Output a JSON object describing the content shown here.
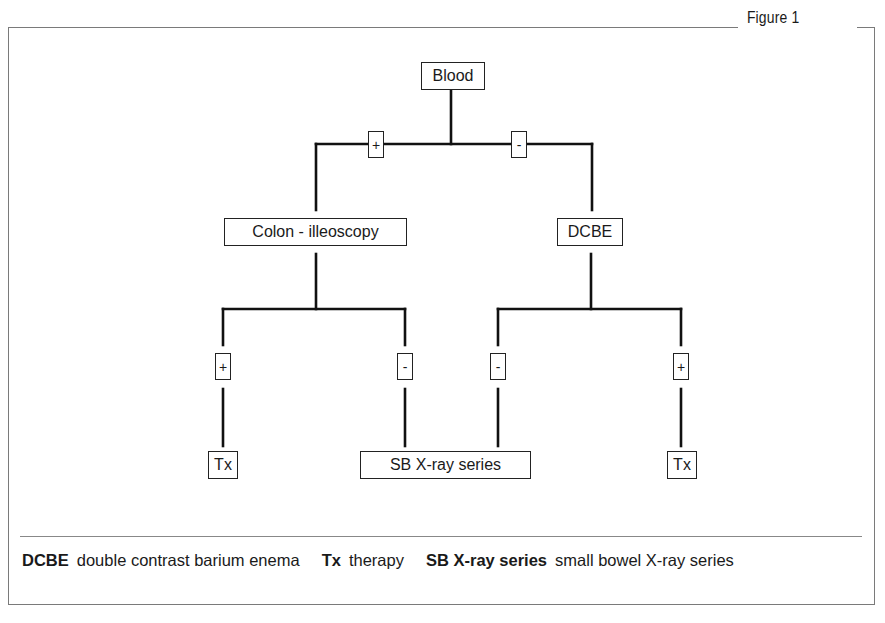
{
  "figure": {
    "title": "Figure 1"
  },
  "diagram": {
    "nodes": {
      "root": "Blood",
      "left": "Colon - illeoscopy",
      "right": "DCBE",
      "left_positive_outcome": "Tx",
      "shared_negative_outcome": "SB X-ray series",
      "right_positive_outcome": "Tx"
    },
    "edge_labels": {
      "root_left": "+",
      "root_right": "-",
      "left_pos": "+",
      "left_neg": "-",
      "right_neg": "-",
      "right_pos": "+"
    },
    "edges": [
      {
        "from": "Blood",
        "to": "Colon - illeoscopy",
        "label": "+"
      },
      {
        "from": "Blood",
        "to": "DCBE",
        "label": "-"
      },
      {
        "from": "Colon - illeoscopy",
        "to": "Tx",
        "label": "+"
      },
      {
        "from": "Colon - illeoscopy",
        "to": "SB X-ray series",
        "label": "-"
      },
      {
        "from": "DCBE",
        "to": "SB X-ray series",
        "label": "-"
      },
      {
        "from": "DCBE",
        "to": "Tx",
        "label": "+"
      }
    ]
  },
  "legend": [
    {
      "term": "DCBE",
      "definition": "double contrast barium enema"
    },
    {
      "term": "Tx",
      "definition": "therapy"
    },
    {
      "term": "SB X-ray series",
      "definition": "small bowel X-ray series"
    }
  ],
  "colors": {
    "line": "#111111",
    "frame": "#7a7a7a",
    "background": "#ffffff"
  }
}
